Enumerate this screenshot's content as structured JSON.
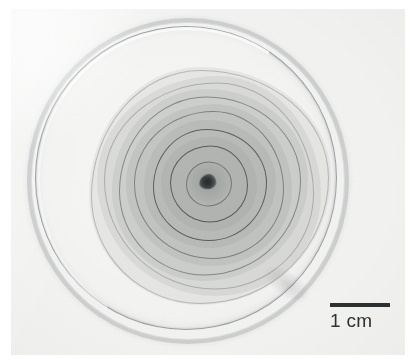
{
  "figure": {
    "domain_kind": "photograph",
    "caption_text": "",
    "background_color": "#f3f3f2",
    "ink_color": "#2f3132"
  },
  "scale_bar": {
    "label": "1 cm",
    "value": 1,
    "unit": "cm",
    "bar_length_px": 60,
    "bar_color": "#2d2f30",
    "position": "bottom-right"
  },
  "petri_dish": {
    "name": "petri-dish",
    "center_px": {
      "x": 184,
      "y": 177
    },
    "outer_radius_px": 157,
    "rim_color": "#7d8284",
    "agar_color": "#f2f2f1"
  },
  "colony": {
    "name": "concentric-ring-colony",
    "center_px": {
      "x": 186,
      "y": 181
    },
    "inoculation_point": {
      "label": "inoculum",
      "color": "#3e4142",
      "width_px": 17,
      "height_px": 15
    },
    "ring_count": 7,
    "outer_edge_radius_px": 118,
    "rings": [
      {
        "index": 1,
        "radius_px": 22,
        "type": "boundary",
        "tone": "strong"
      },
      {
        "index": 2,
        "radius_px": 38,
        "type": "boundary",
        "tone": "strong"
      },
      {
        "index": 3,
        "radius_px": 56,
        "type": "boundary",
        "tone": "normal"
      },
      {
        "index": 4,
        "radius_px": 74,
        "type": "boundary",
        "tone": "normal"
      },
      {
        "index": 5,
        "radius_px": 90,
        "type": "boundary",
        "tone": "faint"
      },
      {
        "index": 6,
        "radius_px": 104,
        "type": "boundary",
        "tone": "faint"
      },
      {
        "index": 7,
        "radius_px": 118,
        "type": "boundary",
        "tone": "faint"
      }
    ],
    "shaded_bands": [
      {
        "index": 1,
        "radius_px": 48
      },
      {
        "index": 2,
        "radius_px": 66
      },
      {
        "index": 3,
        "radius_px": 83
      },
      {
        "index": 4,
        "radius_px": 98
      },
      {
        "index": 5,
        "radius_px": 112
      },
      {
        "index": 6,
        "radius_px": 121
      }
    ]
  }
}
